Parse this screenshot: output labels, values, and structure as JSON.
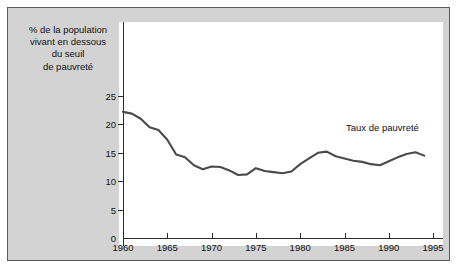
{
  "figure": {
    "background_color": "#ffffff",
    "panel_color": "#d3d3d3",
    "plot_background_color": "#ffffff",
    "border_color": "#5a5a5a",
    "line_color": "#4a4a4a",
    "axis_color": "#2b2b2b"
  },
  "axis_title": {
    "line1": "% de la population",
    "line2": "vivant en dessous",
    "line3": "du seuil",
    "line4": "de pauvreté"
  },
  "annotation": {
    "series_label": "Taux de pauvreté"
  },
  "chart_data": {
    "type": "line",
    "title": "% de la population vivant en dessous du seuil de pauvreté",
    "xlabel": "",
    "ylabel": "% de la population vivant en dessous du seuil de pauvreté",
    "xlim": [
      1959,
      1995
    ],
    "ylim": [
      0,
      26
    ],
    "xticks": [
      1960,
      1965,
      1970,
      1975,
      1980,
      1985,
      1990,
      1995
    ],
    "xtick_labels": [
      "1960",
      "1965",
      "1970",
      "1975",
      "1980",
      "1985",
      "1990",
      "1995"
    ],
    "yticks": [
      0,
      5,
      10,
      15,
      20,
      25
    ],
    "ytick_labels": [
      "0",
      "5",
      "10",
      "15",
      "20",
      "25"
    ],
    "grid": false,
    "legend": "annotation-inline",
    "series": [
      {
        "name": "Taux de pauvreté",
        "color": "#4a4a4a",
        "x": [
          1960,
          1961,
          1962,
          1963,
          1964,
          1965,
          1966,
          1967,
          1968,
          1969,
          1970,
          1971,
          1972,
          1973,
          1974,
          1975,
          1976,
          1977,
          1978,
          1979,
          1980,
          1981,
          1982,
          1983,
          1984,
          1985,
          1986,
          1987,
          1988,
          1989,
          1990,
          1991,
          1992,
          1993,
          1994
        ],
        "values": [
          22.2,
          21.9,
          21.0,
          19.5,
          19.0,
          17.3,
          14.7,
          14.2,
          12.8,
          12.1,
          12.6,
          12.5,
          11.9,
          11.1,
          11.2,
          12.3,
          11.8,
          11.6,
          11.4,
          11.7,
          13.0,
          14.0,
          15.0,
          15.2,
          14.4,
          14.0,
          13.6,
          13.4,
          13.0,
          12.8,
          13.5,
          14.2,
          14.8,
          15.1,
          14.5
        ]
      }
    ]
  }
}
